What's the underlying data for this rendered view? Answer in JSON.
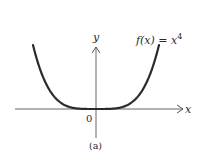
{
  "chart_data": {
    "type": "line",
    "title": "",
    "function_label": "f(x) = x",
    "function_exponent": "4",
    "function": "f(x) = x^4",
    "xlabel": "x",
    "ylabel": "y",
    "origin_label": "0",
    "caption": "(a)",
    "x": [
      -2.0,
      -1.5,
      -1.0,
      -0.5,
      0,
      0.5,
      1.0,
      1.5,
      2.0
    ],
    "series": [
      {
        "name": "f(x) = x^4",
        "values": [
          16,
          5.0625,
          1,
          0.0625,
          0,
          0.0625,
          1,
          5.0625,
          16
        ]
      }
    ],
    "grid": false,
    "legend": "none",
    "colors": {
      "curve": "#2b2b2b",
      "axes": "#555555"
    }
  }
}
